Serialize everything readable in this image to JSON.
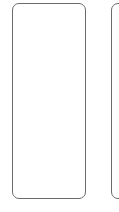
{
  "panels": [
    {
      "id": "left",
      "content": ""
    },
    {
      "id": "right",
      "content": ""
    }
  ],
  "colors": {
    "border": "#6b6b6b",
    "background": "#ffffff"
  }
}
